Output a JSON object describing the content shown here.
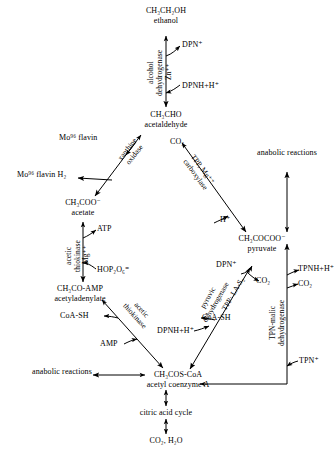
{
  "diagram": {
    "stroke_color": "#000000",
    "background": "#ffffff"
  },
  "nodes": {
    "ethanol": {
      "formula": "CH₃CH₂OH",
      "name": "ethanol"
    },
    "acetaldehyde": {
      "formula": "CH₃CHO",
      "name": "acetaldehyde"
    },
    "acetate": {
      "formula": "CH₃COO⁻",
      "name": "acetate"
    },
    "acetyladenylate": {
      "formula": "CH₃CO-AMP",
      "name": "acetyladenylate"
    },
    "acetyl_coa": {
      "formula": "CH₃COS-CoA",
      "name": "acetyl coenzyme A"
    },
    "pyruvate": {
      "formula": "CH₃COCOO⁻",
      "name": "pyruvate"
    },
    "citric_acid_cycle": {
      "name": "citric acid cycle"
    },
    "end_products": {
      "name": "CO₂, H₂O"
    },
    "anabolic_right": {
      "line1": "anabolic",
      "line2": "reactions"
    },
    "anabolic_left": {
      "line1": "anabolic",
      "line2": "reactions"
    }
  },
  "enzymes": {
    "alcohol_dehydrogenase": {
      "line1": "alcohol",
      "line2": "dehydrogenase"
    },
    "xanthine_oxidase": {
      "line1": "xanthine",
      "line2": "oxidase"
    },
    "carboxylase": {
      "line1": "TPP, Mg⁺⁺",
      "line2": "carboxylase"
    },
    "acetic_thiokinase_1": {
      "line1": "acetic",
      "line2": "thiokinase"
    },
    "acetic_thiokinase_2": {
      "line1": "acetic",
      "line2": "thiokinase"
    },
    "pyruvic_dehydrogenase": {
      "line1": "pyruvic",
      "line2": "dehydrogenase"
    },
    "tpp_la_s": {
      "text": "TPP· LA-S₂"
    },
    "tpn_malic_dehydrogenase": {
      "line1": "TPN-malic",
      "line2": "dehydrogenase"
    }
  },
  "cofactors": {
    "dpn_plus_top": "DPN⁺",
    "zn": "Zn⁺⁺",
    "dpnh_h_top": "DPNH+H⁺",
    "mo_flavin": "Mo⁹⁶ flavin",
    "mo_flavin_h2": "Mo⁹⁶ flavin H₂",
    "co2_acetaldehyde": "CO₂",
    "h_plus": "H⁺",
    "atp": "ATP",
    "mg": "Mg⁺⁺",
    "hop2o6": "HOP₂O₆⁼",
    "coash_upper": "CoA-SH",
    "amp": "AMP",
    "dpn_plus_pyr": "DPN⁺",
    "co2_pyr": "CO₂",
    "coash_lower": "CoA-SH",
    "dpnh_h_lower": "DPNH+H⁺",
    "tpnh_h": "TPNH+H⁺",
    "co2_malic": "CO₂",
    "tpn_plus": "TPN⁺"
  }
}
